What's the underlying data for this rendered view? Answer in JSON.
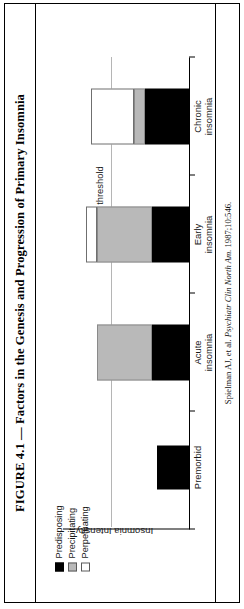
{
  "figure": {
    "title": "FIGURE 4.1 — Factors in the Genesis and Progression of Primary Insomnia",
    "credit_author": "Spielman AJ, et al. ",
    "credit_journal": "Psychiatr Clin North Am.",
    "credit_cite": " 1987;10:546."
  },
  "legend": {
    "items": [
      {
        "label": "Predisposing",
        "color": "#000000"
      },
      {
        "label": "Precipitating",
        "color": "#b9b9b9"
      },
      {
        "label": "Perpetuating",
        "color": "#ffffff"
      }
    ]
  },
  "chart_data": {
    "type": "bar",
    "title": "Factors in the Genesis and Progression of Primary Insomnia",
    "xlabel": "",
    "ylabel": "Insomnia Intensity",
    "categories": [
      "Premorbid",
      "Acute insomnia",
      "Early insomnia",
      "Chronic insomnia"
    ],
    "category_lines": [
      [
        "Premorbid",
        ""
      ],
      [
        "Acute",
        "insomnia"
      ],
      [
        "Early",
        "insomnia"
      ],
      [
        "Chronic",
        "insomnia"
      ]
    ],
    "series": [
      {
        "name": "Predisposing",
        "values": [
          28,
          32,
          32,
          38
        ]
      },
      {
        "name": "Precipitating",
        "values": [
          0,
          48,
          48,
          10
        ]
      },
      {
        "name": "Perpetuating",
        "values": [
          0,
          0,
          10,
          38
        ]
      }
    ],
    "stacked": true,
    "ylim": [
      0,
      110
    ],
    "grid": false,
    "legend_position": "top-left",
    "annotations": [
      {
        "text": "Insomnia threshold",
        "type": "threshold-line",
        "value": 68
      }
    ]
  }
}
